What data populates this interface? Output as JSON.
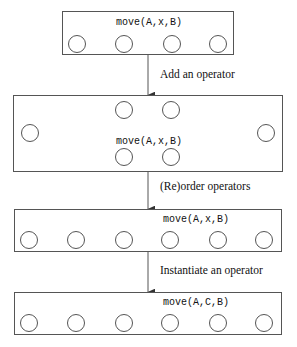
{
  "diagram": {
    "colors": {
      "stroke": "#555555",
      "text": "#111111",
      "background": "#ffffff"
    },
    "stages": [
      {
        "id": "stage-1",
        "box": {
          "x": 62,
          "y": 11,
          "w": 172,
          "h": 44
        },
        "operators": [
          {
            "label": "move(A,x,B)",
            "label_x": 116,
            "label_y": 17
          }
        ],
        "nodes": [
          {
            "cx": 77,
            "cy": 44,
            "r": 9
          },
          {
            "cx": 124,
            "cy": 44,
            "r": 9
          },
          {
            "cx": 172,
            "cy": 44,
            "r": 9
          },
          {
            "cx": 218,
            "cy": 44,
            "r": 9
          }
        ],
        "links": [
          {
            "x1": 133,
            "y1": 44,
            "x2": 163,
            "y2": 44
          }
        ]
      },
      {
        "id": "stage-2",
        "box": {
          "x": 13,
          "y": 95,
          "w": 270,
          "h": 77
        },
        "operators": [
          {
            "label": "move(A,x,B)",
            "label_x": 116,
            "label_y": 136
          }
        ],
        "nodes": [
          {
            "cx": 30,
            "cy": 133,
            "r": 9
          },
          {
            "cx": 124,
            "cy": 110,
            "r": 9
          },
          {
            "cx": 171,
            "cy": 110,
            "r": 9
          },
          {
            "cx": 124,
            "cy": 157,
            "r": 9
          },
          {
            "cx": 171,
            "cy": 157,
            "r": 9
          },
          {
            "cx": 266,
            "cy": 133,
            "r": 9
          }
        ],
        "links": [
          {
            "x1": 133,
            "y1": 110,
            "x2": 162,
            "y2": 110
          },
          {
            "x1": 133,
            "y1": 157,
            "x2": 162,
            "y2": 157
          }
        ]
      },
      {
        "id": "stage-3",
        "box": {
          "x": 14,
          "y": 209,
          "w": 268,
          "h": 43
        },
        "operators": [
          {
            "label": "move(A,x,B)",
            "label_x": 163,
            "label_y": 214
          }
        ],
        "nodes": [
          {
            "cx": 29,
            "cy": 240,
            "r": 9
          },
          {
            "cx": 76,
            "cy": 240,
            "r": 9
          },
          {
            "cx": 124,
            "cy": 240,
            "r": 9
          },
          {
            "cx": 170,
            "cy": 240,
            "r": 9
          },
          {
            "cx": 218,
            "cy": 240,
            "r": 9
          },
          {
            "cx": 264,
            "cy": 240,
            "r": 9
          }
        ],
        "links": [
          {
            "x1": 85,
            "y1": 240,
            "x2": 115,
            "y2": 240
          },
          {
            "x1": 179,
            "y1": 240,
            "x2": 209,
            "y2": 240
          }
        ]
      },
      {
        "id": "stage-4",
        "box": {
          "x": 14,
          "y": 292,
          "w": 268,
          "h": 43
        },
        "operators": [
          {
            "label": "move(A,C,B)",
            "label_x": 163,
            "label_y": 297
          }
        ],
        "nodes": [
          {
            "cx": 29,
            "cy": 323,
            "r": 9
          },
          {
            "cx": 76,
            "cy": 323,
            "r": 9
          },
          {
            "cx": 124,
            "cy": 323,
            "r": 9
          },
          {
            "cx": 170,
            "cy": 323,
            "r": 9
          },
          {
            "cx": 218,
            "cy": 323,
            "r": 9
          },
          {
            "cx": 264,
            "cy": 323,
            "r": 9
          }
        ],
        "links": [
          {
            "x1": 85,
            "y1": 323,
            "x2": 115,
            "y2": 323
          },
          {
            "x1": 179,
            "y1": 323,
            "x2": 209,
            "y2": 323
          }
        ]
      }
    ],
    "transitions": [
      {
        "id": "transition-add-operator",
        "label": "Add an operator",
        "label_x": 160,
        "label_y": 68,
        "x": 148,
        "y1": 55,
        "y2": 95
      },
      {
        "id": "transition-reorder-operators",
        "label": "(Re)order operators",
        "label_x": 160,
        "label_y": 180,
        "x": 148,
        "y1": 172,
        "y2": 209
      },
      {
        "id": "transition-instantiate-operator",
        "label": "Instantiate an operator",
        "label_x": 160,
        "label_y": 264,
        "x": 148,
        "y1": 252,
        "y2": 292
      }
    ]
  }
}
